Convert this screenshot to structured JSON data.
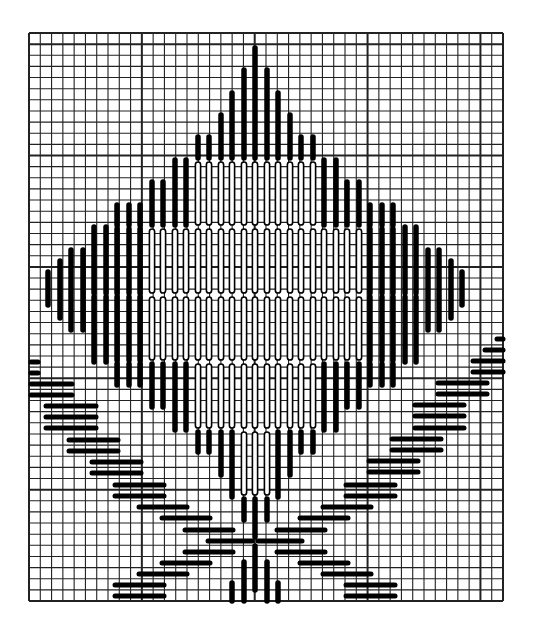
{
  "figure": {
    "type": "needlepoint-stitch-chart",
    "colors": {
      "background": "#ffffff",
      "grid": "#222222",
      "stitch": "#000000"
    }
  },
  "grid": {
    "x0": 29,
    "y0": 33,
    "x1": 503,
    "y1": 601,
    "cols": 42,
    "rows": 51,
    "heavy_every": 10,
    "heavy_col_offset": 0,
    "heavy_row_offset": 1
  },
  "vertical_stitches": [
    {
      "x": 48,
      "y1": 272,
      "y2": 305,
      "style": "solid"
    },
    {
      "x": 60,
      "y1": 261,
      "y2": 318,
      "style": "solid"
    },
    {
      "x": 71,
      "y1": 250,
      "y2": 330,
      "style": "solid"
    },
    {
      "x": 83,
      "y1": 250,
      "y2": 330,
      "style": "solid"
    },
    {
      "x": 94,
      "y1": 227,
      "y2": 362,
      "style": "segmented"
    },
    {
      "x": 106,
      "y1": 227,
      "y2": 362,
      "style": "segmented"
    },
    {
      "x": 117,
      "y1": 205,
      "y2": 385,
      "style": "segmented"
    },
    {
      "x": 129,
      "y1": 205,
      "y2": 385,
      "style": "segmented"
    },
    {
      "x": 140,
      "y1": 205,
      "y2": 385,
      "style": "segmented"
    },
    {
      "x": 152,
      "y1": 182,
      "y2": 407,
      "style": "hollow"
    },
    {
      "x": 163,
      "y1": 182,
      "y2": 407,
      "style": "hollow"
    },
    {
      "x": 175,
      "y1": 160,
      "y2": 430,
      "style": "hollow"
    },
    {
      "x": 186,
      "y1": 160,
      "y2": 430,
      "style": "hollow"
    },
    {
      "x": 198,
      "y1": 137,
      "y2": 452,
      "style": "hollow"
    },
    {
      "x": 209,
      "y1": 137,
      "y2": 452,
      "style": "hollow"
    },
    {
      "x": 221,
      "y1": 115,
      "y2": 475,
      "style": "hollow"
    },
    {
      "x": 232,
      "y1": 93,
      "y2": 497,
      "style": "hollow"
    },
    {
      "x": 244,
      "y1": 70,
      "y2": 520,
      "style": "hollow"
    },
    {
      "x": 255,
      "y1": 48,
      "y2": 537,
      "style": "hollow"
    },
    {
      "x": 267,
      "y1": 70,
      "y2": 520,
      "style": "hollow"
    },
    {
      "x": 278,
      "y1": 93,
      "y2": 497,
      "style": "hollow"
    },
    {
      "x": 290,
      "y1": 115,
      "y2": 475,
      "style": "hollow"
    },
    {
      "x": 301,
      "y1": 137,
      "y2": 452,
      "style": "hollow"
    },
    {
      "x": 313,
      "y1": 137,
      "y2": 452,
      "style": "hollow"
    },
    {
      "x": 324,
      "y1": 160,
      "y2": 430,
      "style": "hollow"
    },
    {
      "x": 336,
      "y1": 160,
      "y2": 430,
      "style": "hollow"
    },
    {
      "x": 347,
      "y1": 182,
      "y2": 407,
      "style": "hollow"
    },
    {
      "x": 359,
      "y1": 182,
      "y2": 407,
      "style": "hollow"
    },
    {
      "x": 370,
      "y1": 205,
      "y2": 385,
      "style": "segmented"
    },
    {
      "x": 382,
      "y1": 205,
      "y2": 385,
      "style": "segmented"
    },
    {
      "x": 393,
      "y1": 205,
      "y2": 385,
      "style": "segmented"
    },
    {
      "x": 405,
      "y1": 227,
      "y2": 362,
      "style": "segmented"
    },
    {
      "x": 416,
      "y1": 227,
      "y2": 362,
      "style": "segmented"
    },
    {
      "x": 428,
      "y1": 250,
      "y2": 330,
      "style": "solid"
    },
    {
      "x": 439,
      "y1": 250,
      "y2": 330,
      "style": "solid"
    },
    {
      "x": 451,
      "y1": 261,
      "y2": 318,
      "style": "solid"
    },
    {
      "x": 462,
      "y1": 272,
      "y2": 305,
      "style": "solid"
    },
    {
      "x": 255,
      "y1": 546,
      "y2": 590,
      "style": "solid"
    },
    {
      "x": 244,
      "y1": 562,
      "y2": 601,
      "style": "solid"
    },
    {
      "x": 267,
      "y1": 562,
      "y2": 601,
      "style": "solid"
    },
    {
      "x": 232,
      "y1": 583,
      "y2": 601,
      "style": "solid"
    },
    {
      "x": 278,
      "y1": 583,
      "y2": 601,
      "style": "solid"
    }
  ],
  "horizontal_stitches": [
    {
      "y": 362,
      "x1": 31,
      "x2": 38
    },
    {
      "y": 373,
      "x1": 31,
      "x2": 38
    },
    {
      "y": 384,
      "x1": 31,
      "x2": 72
    },
    {
      "y": 395,
      "x1": 31,
      "x2": 72
    },
    {
      "y": 406,
      "x1": 46,
      "x2": 96
    },
    {
      "y": 417,
      "x1": 46,
      "x2": 96
    },
    {
      "y": 428,
      "x1": 46,
      "x2": 96
    },
    {
      "y": 440,
      "x1": 69,
      "x2": 118
    },
    {
      "y": 451,
      "x1": 69,
      "x2": 118
    },
    {
      "y": 462,
      "x1": 92,
      "x2": 141
    },
    {
      "y": 473,
      "x1": 92,
      "x2": 141
    },
    {
      "y": 485,
      "x1": 115,
      "x2": 164
    },
    {
      "y": 496,
      "x1": 115,
      "x2": 164
    },
    {
      "y": 507,
      "x1": 139,
      "x2": 187
    },
    {
      "y": 518,
      "x1": 162,
      "x2": 210
    },
    {
      "y": 530,
      "x1": 185,
      "x2": 233
    },
    {
      "y": 541,
      "x1": 208,
      "x2": 252
    },
    {
      "y": 552,
      "x1": 185,
      "x2": 233
    },
    {
      "y": 563,
      "x1": 162,
      "x2": 210
    },
    {
      "y": 574,
      "x1": 139,
      "x2": 187
    },
    {
      "y": 585,
      "x1": 115,
      "x2": 164
    },
    {
      "y": 596,
      "x1": 115,
      "x2": 164
    },
    {
      "y": 339,
      "x1": 497,
      "x2": 503
    },
    {
      "y": 350,
      "x1": 485,
      "x2": 503
    },
    {
      "y": 361,
      "x1": 473,
      "x2": 503
    },
    {
      "y": 372,
      "x1": 473,
      "x2": 503
    },
    {
      "y": 383,
      "x1": 438,
      "x2": 487
    },
    {
      "y": 394,
      "x1": 438,
      "x2": 487
    },
    {
      "y": 405,
      "x1": 415,
      "x2": 464
    },
    {
      "y": 416,
      "x1": 415,
      "x2": 464
    },
    {
      "y": 428,
      "x1": 415,
      "x2": 464
    },
    {
      "y": 439,
      "x1": 392,
      "x2": 441
    },
    {
      "y": 450,
      "x1": 392,
      "x2": 441
    },
    {
      "y": 461,
      "x1": 369,
      "x2": 418
    },
    {
      "y": 472,
      "x1": 369,
      "x2": 418
    },
    {
      "y": 485,
      "x1": 346,
      "x2": 395
    },
    {
      "y": 496,
      "x1": 346,
      "x2": 395
    },
    {
      "y": 507,
      "x1": 323,
      "x2": 371
    },
    {
      "y": 518,
      "x1": 300,
      "x2": 348
    },
    {
      "y": 530,
      "x1": 277,
      "x2": 325
    },
    {
      "y": 541,
      "x1": 258,
      "x2": 302
    },
    {
      "y": 552,
      "x1": 277,
      "x2": 325
    },
    {
      "y": 563,
      "x1": 300,
      "x2": 348
    },
    {
      "y": 574,
      "x1": 323,
      "x2": 371
    },
    {
      "y": 585,
      "x1": 346,
      "x2": 395
    },
    {
      "y": 596,
      "x1": 346,
      "x2": 395
    }
  ],
  "segment_gap_rows": [
    160,
    227,
    295,
    362,
    430,
    497
  ]
}
